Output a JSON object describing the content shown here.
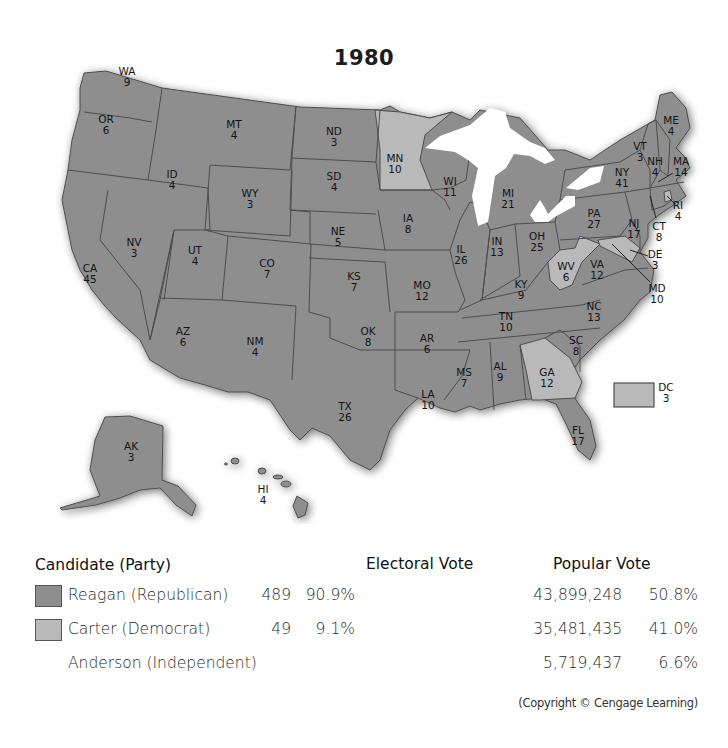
{
  "title": "1980",
  "colors": {
    "reagan": "#8e8e8e",
    "carter": "#b9b9b9",
    "lakes": "#ffffff",
    "border": "#4d4d4d"
  },
  "legend": {
    "headers": {
      "candidate": "Candidate (Party)",
      "electoral": "Electoral Vote",
      "popular": "Popular Vote"
    },
    "rows": [
      {
        "name": "Reagan (Republican)",
        "electoral_votes": "489",
        "electoral_pct": "90.9%",
        "popular_votes": "43,899,248",
        "popular_pct": "50.8%",
        "color": "#8e8e8e"
      },
      {
        "name": "Carter (Democrat)",
        "electoral_votes": "49",
        "electoral_pct": "9.1%",
        "popular_votes": "35,481,435",
        "popular_pct": "41.0%",
        "color": "#b9b9b9"
      },
      {
        "name": "Anderson (Independent)",
        "electoral_votes": "",
        "electoral_pct": "",
        "popular_votes": "5,719,437",
        "popular_pct": "6.6%",
        "color": ""
      }
    ]
  },
  "copyright": "(Copyright © Cengage Learning)",
  "states": [
    {
      "abbr": "WA",
      "ev": "9",
      "winner": "reagan",
      "x": 127,
      "y": 75
    },
    {
      "abbr": "OR",
      "ev": "6",
      "winner": "reagan",
      "x": 106,
      "y": 123
    },
    {
      "abbr": "ID",
      "ev": "4",
      "winner": "reagan",
      "x": 172,
      "y": 178
    },
    {
      "abbr": "MT",
      "ev": "4",
      "winner": "reagan",
      "x": 234,
      "y": 128
    },
    {
      "abbr": "WY",
      "ev": "3",
      "winner": "reagan",
      "x": 250,
      "y": 197
    },
    {
      "abbr": "ND",
      "ev": "3",
      "winner": "reagan",
      "x": 334,
      "y": 135
    },
    {
      "abbr": "SD",
      "ev": "4",
      "winner": "reagan",
      "x": 334,
      "y": 180
    },
    {
      "abbr": "NE",
      "ev": "5",
      "winner": "reagan",
      "x": 338,
      "y": 235
    },
    {
      "abbr": "KS",
      "ev": "7",
      "winner": "reagan",
      "x": 354,
      "y": 280
    },
    {
      "abbr": "OK",
      "ev": "8",
      "winner": "reagan",
      "x": 368,
      "y": 335
    },
    {
      "abbr": "TX",
      "ev": "26",
      "winner": "reagan",
      "x": 345,
      "y": 410
    },
    {
      "abbr": "MN",
      "ev": "10",
      "winner": "carter",
      "x": 395,
      "y": 162
    },
    {
      "abbr": "IA",
      "ev": "8",
      "winner": "reagan",
      "x": 408,
      "y": 222
    },
    {
      "abbr": "MO",
      "ev": "12",
      "winner": "reagan",
      "x": 422,
      "y": 289
    },
    {
      "abbr": "AR",
      "ev": "6",
      "winner": "reagan",
      "x": 427,
      "y": 342
    },
    {
      "abbr": "LA",
      "ev": "10",
      "winner": "reagan",
      "x": 428,
      "y": 398
    },
    {
      "abbr": "WI",
      "ev": "11",
      "winner": "reagan",
      "x": 450,
      "y": 185
    },
    {
      "abbr": "IL",
      "ev": "26",
      "winner": "reagan",
      "x": 461,
      "y": 253
    },
    {
      "abbr": "MI",
      "ev": "21",
      "winner": "reagan",
      "x": 508,
      "y": 197
    },
    {
      "abbr": "IN",
      "ev": "13",
      "winner": "reagan",
      "x": 497,
      "y": 245
    },
    {
      "abbr": "OH",
      "ev": "25",
      "winner": "reagan",
      "x": 537,
      "y": 240
    },
    {
      "abbr": "KY",
      "ev": "9",
      "winner": "reagan",
      "x": 521,
      "y": 288
    },
    {
      "abbr": "TN",
      "ev": "10",
      "winner": "reagan",
      "x": 506,
      "y": 320
    },
    {
      "abbr": "MS",
      "ev": "7",
      "winner": "reagan",
      "x": 464,
      "y": 376
    },
    {
      "abbr": "AL",
      "ev": "9",
      "winner": "reagan",
      "x": 500,
      "y": 370
    },
    {
      "abbr": "GA",
      "ev": "12",
      "winner": "carter",
      "x": 547,
      "y": 376
    },
    {
      "abbr": "FL",
      "ev": "17",
      "winner": "reagan",
      "x": 578,
      "y": 434
    },
    {
      "abbr": "SC",
      "ev": "8",
      "winner": "reagan",
      "x": 576,
      "y": 344
    },
    {
      "abbr": "NC",
      "ev": "13",
      "winner": "reagan",
      "x": 594,
      "y": 310
    },
    {
      "abbr": "VA",
      "ev": "12",
      "winner": "reagan",
      "x": 597,
      "y": 268
    },
    {
      "abbr": "WV",
      "ev": "6",
      "winner": "carter",
      "x": 566,
      "y": 270
    },
    {
      "abbr": "PA",
      "ev": "27",
      "winner": "reagan",
      "x": 594,
      "y": 217
    },
    {
      "abbr": "NY",
      "ev": "41",
      "winner": "reagan",
      "x": 622,
      "y": 176
    },
    {
      "abbr": "NJ",
      "ev": "17",
      "winner": "reagan",
      "x": 634,
      "y": 227
    },
    {
      "abbr": "VT",
      "ev": "3",
      "winner": "reagan",
      "x": 640,
      "y": 150
    },
    {
      "abbr": "NH",
      "ev": "4",
      "winner": "reagan",
      "x": 655,
      "y": 165
    },
    {
      "abbr": "ME",
      "ev": "4",
      "winner": "reagan",
      "x": 671,
      "y": 124
    },
    {
      "abbr": "MA",
      "ev": "14",
      "winner": "reagan",
      "x": 681,
      "y": 165
    },
    {
      "abbr": "RI",
      "ev": "4",
      "winner": "carter",
      "x": 678,
      "y": 209
    },
    {
      "abbr": "CT",
      "ev": "8",
      "winner": "reagan",
      "x": 659,
      "y": 230
    },
    {
      "abbr": "DE",
      "ev": "3",
      "winner": "reagan",
      "x": 655,
      "y": 258
    },
    {
      "abbr": "MD",
      "ev": "10",
      "winner": "carter",
      "x": 657,
      "y": 292
    },
    {
      "abbr": "DC",
      "ev": "3",
      "winner": "carter",
      "x": 666,
      "y": 391
    },
    {
      "abbr": "NV",
      "ev": "3",
      "winner": "reagan",
      "x": 134,
      "y": 246
    },
    {
      "abbr": "UT",
      "ev": "4",
      "winner": "reagan",
      "x": 195,
      "y": 254
    },
    {
      "abbr": "CO",
      "ev": "7",
      "winner": "reagan",
      "x": 267,
      "y": 267
    },
    {
      "abbr": "CA",
      "ev": "45",
      "winner": "reagan",
      "x": 90,
      "y": 272
    },
    {
      "abbr": "AZ",
      "ev": "6",
      "winner": "reagan",
      "x": 183,
      "y": 335
    },
    {
      "abbr": "NM",
      "ev": "4",
      "winner": "reagan",
      "x": 255,
      "y": 345
    },
    {
      "abbr": "AK",
      "ev": "3",
      "winner": "reagan",
      "x": 131,
      "y": 450
    },
    {
      "abbr": "HI",
      "ev": "4",
      "winner": "carter",
      "x": 263,
      "y": 493
    }
  ]
}
